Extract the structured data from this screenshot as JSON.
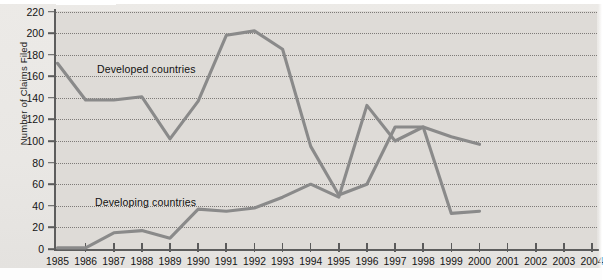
{
  "chart_data": {
    "type": "line",
    "title": "",
    "xlabel": "",
    "ylabel": "Number of Claims Filed",
    "x": [
      1985,
      1986,
      1987,
      1988,
      1989,
      1990,
      1991,
      1992,
      1993,
      1994,
      1995,
      1996,
      1997,
      1998,
      1999,
      2000,
      2001,
      2002,
      2003,
      2004
    ],
    "xtick_labels": [
      "1985",
      "1986",
      "1987",
      "1988",
      "1989",
      "1990",
      "1991",
      "1992",
      "1993",
      "1994",
      "1995",
      "1996",
      "1997",
      "1998",
      "1999",
      "2000",
      "2001",
      "2002",
      "2003",
      "2004"
    ],
    "ytick_labels": [
      "0",
      "20",
      "40",
      "60",
      "80",
      "100",
      "120",
      "140",
      "160",
      "180",
      "200",
      "220"
    ],
    "yticks": [
      0,
      20,
      40,
      60,
      80,
      100,
      120,
      140,
      160,
      180,
      200,
      220
    ],
    "ylim": [
      0,
      225
    ],
    "xlim": [
      1985,
      2004
    ],
    "grid": "horizontal-dotted",
    "legend": "inline-annotations",
    "series": [
      {
        "name": "Developed countries",
        "label_x": 1987,
        "label_y": 168,
        "values": [
          172,
          138,
          138,
          141,
          102,
          137,
          198,
          202,
          185,
          95,
          50,
          60,
          113,
          113,
          33,
          35,
          null,
          null,
          null,
          null
        ]
      },
      {
        "name": "Developing countries",
        "label_x": 1987,
        "label_y": 52,
        "values": [
          1,
          1,
          15,
          17,
          10,
          37,
          35,
          38,
          48,
          60,
          48,
          133,
          100,
          113,
          104,
          97,
          null,
          null,
          null,
          null
        ]
      }
    ],
    "line_color": "#8a8a8a",
    "plot_bg": "#dedbd7",
    "annotations": [
      {
        "text": "Developed countries"
      },
      {
        "text": "Developing countries"
      }
    ]
  }
}
